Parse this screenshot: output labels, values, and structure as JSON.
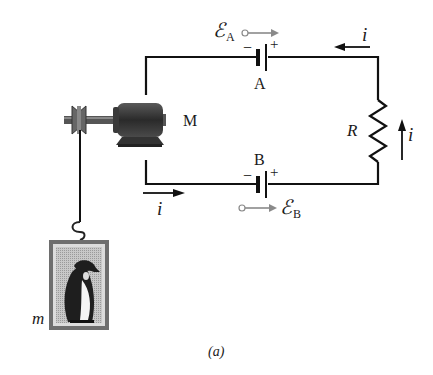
{
  "figure": {
    "caption": "(a)",
    "colors": {
      "wire": "#111111",
      "motor_body": "#3a3a3a",
      "emf_arrow": "#8a8a8a",
      "frame": "#6e6e6e",
      "frame_inner": "#bdbdbd"
    }
  },
  "battery_a": {
    "name": "A",
    "minus": "−",
    "plus": "+",
    "emf_symbol": "ℰ",
    "emf_subscript": "A"
  },
  "battery_b": {
    "name": "B",
    "minus": "−",
    "plus": "+",
    "emf_symbol": "ℰ",
    "emf_subscript": "B"
  },
  "motor": {
    "label": "M"
  },
  "resistor": {
    "label": "R"
  },
  "mass": {
    "label": "m"
  },
  "currents": {
    "top": "i",
    "right": "i",
    "bottom": "i"
  }
}
